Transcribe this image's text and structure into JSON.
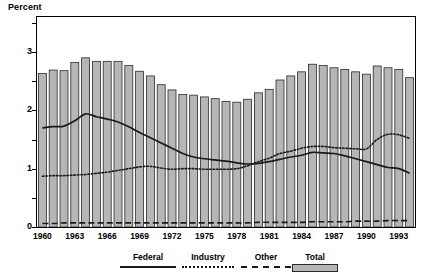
{
  "figure": {
    "y_axis_title": "Percent"
  },
  "legend": {
    "items": [
      {
        "label": "Federal",
        "style": "solid-line",
        "color": "#1a1a1a"
      },
      {
        "label": "Industry",
        "style": "dotted-line",
        "color": "#1a1a1a"
      },
      {
        "label": "Other",
        "style": "dashed-line",
        "color": "#1a1a1a"
      },
      {
        "label": "Total",
        "style": "filled-box",
        "color": "#b6b6b6"
      }
    ]
  },
  "axes": {
    "y_major_ticks": [
      "0",
      "1",
      "2",
      "3"
    ],
    "y_minor_tick_values": [
      0.5,
      1.5,
      2.5,
      3.5
    ],
    "x_tick_labels": [
      "1960",
      "1963",
      "1966",
      "1969",
      "1972",
      "1975",
      "1978",
      "1981",
      "1984",
      "1987",
      "1990",
      "1993"
    ]
  },
  "chart_data": {
    "type": "bar",
    "title": "",
    "subtitle": "",
    "xlabel": "",
    "ylabel": "Percent",
    "ylim": [
      0,
      3.6
    ],
    "grid": false,
    "legend_position": "bottom",
    "categories": [
      "1960",
      "1961",
      "1962",
      "1963",
      "1964",
      "1965",
      "1966",
      "1967",
      "1968",
      "1969",
      "1970",
      "1971",
      "1972",
      "1973",
      "1974",
      "1975",
      "1976",
      "1977",
      "1978",
      "1979",
      "1980",
      "1981",
      "1982",
      "1983",
      "1984",
      "1985",
      "1986",
      "1987",
      "1988",
      "1989",
      "1990",
      "1991",
      "1992",
      "1993",
      "1994"
    ],
    "series": [
      {
        "name": "Total",
        "render": "bar",
        "color": "#b6b6b6",
        "values": [
          2.63,
          2.69,
          2.68,
          2.82,
          2.9,
          2.84,
          2.84,
          2.84,
          2.77,
          2.67,
          2.59,
          2.44,
          2.35,
          2.27,
          2.26,
          2.23,
          2.2,
          2.15,
          2.14,
          2.19,
          2.3,
          2.36,
          2.52,
          2.59,
          2.66,
          2.79,
          2.77,
          2.73,
          2.7,
          2.66,
          2.62,
          2.76,
          2.73,
          2.7,
          2.56
        ]
      },
      {
        "name": "Federal",
        "render": "line",
        "style": "solid",
        "color": "#1a1a1a",
        "values": [
          1.7,
          1.72,
          1.73,
          1.82,
          1.94,
          1.89,
          1.85,
          1.8,
          1.72,
          1.62,
          1.53,
          1.44,
          1.35,
          1.26,
          1.2,
          1.17,
          1.15,
          1.13,
          1.1,
          1.08,
          1.09,
          1.12,
          1.16,
          1.2,
          1.23,
          1.28,
          1.27,
          1.26,
          1.22,
          1.17,
          1.12,
          1.07,
          1.02,
          1.0,
          0.92
        ]
      },
      {
        "name": "Industry",
        "render": "line",
        "style": "dotted",
        "color": "#1a1a1a",
        "values": [
          0.87,
          0.88,
          0.88,
          0.89,
          0.9,
          0.92,
          0.94,
          0.97,
          1.0,
          1.03,
          1.04,
          1.01,
          0.99,
          1.0,
          1.0,
          0.99,
          0.99,
          0.99,
          1.0,
          1.05,
          1.12,
          1.18,
          1.26,
          1.3,
          1.35,
          1.38,
          1.38,
          1.36,
          1.35,
          1.34,
          1.34,
          1.5,
          1.59,
          1.58,
          1.52
        ]
      },
      {
        "name": "Other",
        "render": "line",
        "style": "dashed",
        "color": "#1a1a1a",
        "values": [
          0.06,
          0.06,
          0.07,
          0.07,
          0.07,
          0.07,
          0.07,
          0.07,
          0.07,
          0.07,
          0.07,
          0.07,
          0.07,
          0.07,
          0.07,
          0.07,
          0.07,
          0.07,
          0.07,
          0.07,
          0.08,
          0.08,
          0.08,
          0.08,
          0.08,
          0.09,
          0.09,
          0.09,
          0.09,
          0.1,
          0.1,
          0.1,
          0.11,
          0.11,
          0.11
        ]
      }
    ]
  }
}
